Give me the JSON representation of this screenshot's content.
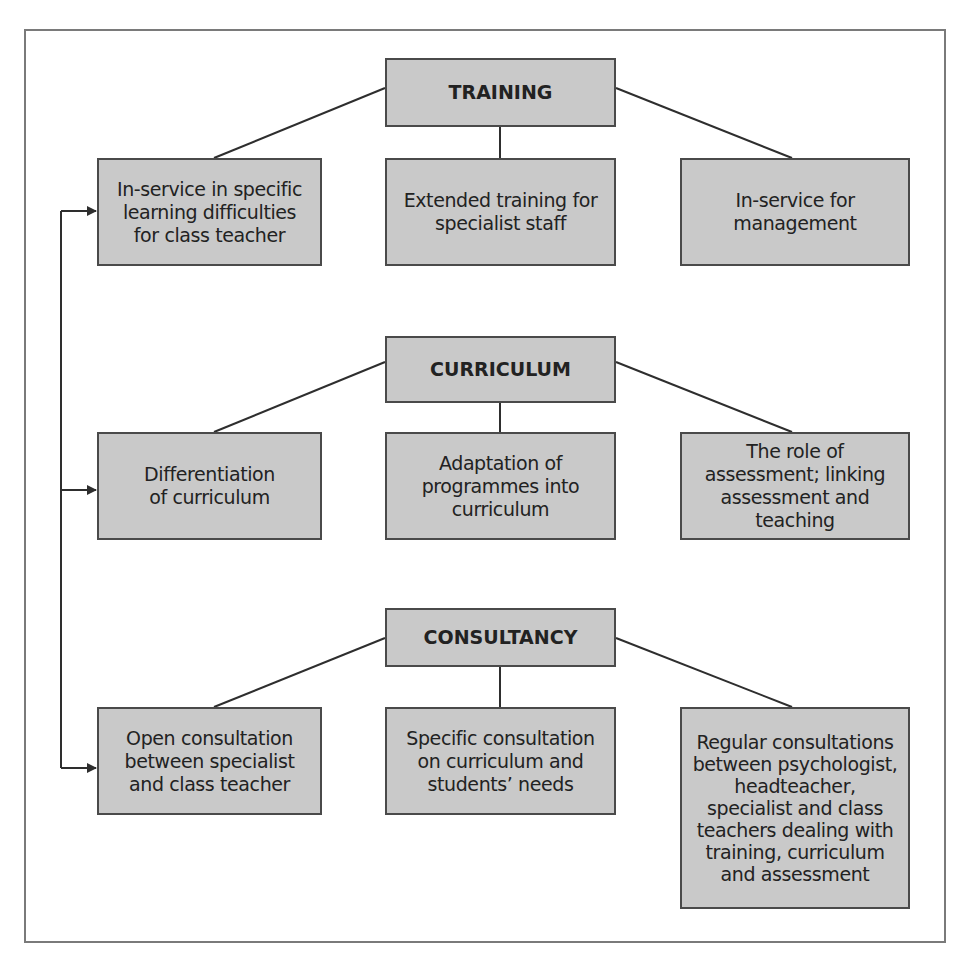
{
  "diagram": {
    "groups": [
      {
        "title": "TRAINING",
        "children": [
          "In-service in specific\nlearning difficulties\nfor class teacher",
          "Extended training for\nspecialist staff",
          "In-service for\nmanagement"
        ]
      },
      {
        "title": "CURRICULUM",
        "children": [
          "Differentiation\nof curriculum",
          "Adaptation of\nprogrammes into\ncurriculum",
          "The role of\nassessment; linking\nassessment and\nteaching"
        ]
      },
      {
        "title": "CONSULTANCY",
        "children": [
          "Open consultation\nbetween specialist\nand class teacher",
          "Specific consultation\non curriculum and\nstudents’ needs",
          "Regular consultations\nbetween psychologist,\nheadteacher,\nspecialist and class\nteachers dealing with\ntraining, curriculum\nand assessment"
        ]
      }
    ],
    "feedback_arrow": {
      "description": "vertical connector linking the left-column boxes of all three groups",
      "targets": [
        "groups.0.children.0",
        "groups.1.children.0",
        "groups.2.children.0"
      ]
    },
    "colors": {
      "box_fill": "#c9c9c9",
      "box_border": "#4a4a4a",
      "line": "#2e2e2e",
      "frame": "#7a7a7a"
    }
  }
}
